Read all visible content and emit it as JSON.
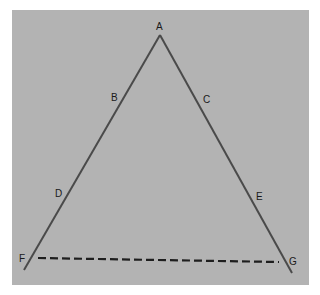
{
  "diagram": {
    "background_color": "#b3b3b3",
    "line_color": "#4a4a4a",
    "dash_color": "#1e1e1e",
    "points": [
      {
        "id": "A",
        "label": "A",
        "x": 160,
        "y": 35,
        "lx": 156,
        "ly": 22
      },
      {
        "id": "B",
        "label": "B",
        "x": 124,
        "y": 98,
        "lx": 111,
        "ly": 93
      },
      {
        "id": "C",
        "label": "C",
        "x": 196,
        "y": 98,
        "lx": 203,
        "ly": 95
      },
      {
        "id": "D",
        "label": "D",
        "x": 66,
        "y": 193,
        "lx": 55,
        "ly": 189
      },
      {
        "id": "E",
        "label": "E",
        "x": 250,
        "y": 193,
        "lx": 256,
        "ly": 192
      },
      {
        "id": "F",
        "label": "F",
        "x": 30,
        "y": 259,
        "lx": 19,
        "ly": 254
      },
      {
        "id": "G",
        "label": "G",
        "x": 284,
        "y": 262,
        "lx": 289,
        "ly": 257
      }
    ],
    "segments": [
      {
        "name": "line-A-F",
        "from": [
          160,
          35
        ],
        "to": [
          24,
          270
        ],
        "style": "solid"
      },
      {
        "name": "line-A-G",
        "from": [
          160,
          35
        ],
        "to": [
          292,
          273
        ],
        "style": "solid"
      },
      {
        "name": "line-F-G-dashed",
        "from": [
          38,
          258
        ],
        "to": [
          279,
          262
        ],
        "style": "dashed"
      }
    ]
  }
}
